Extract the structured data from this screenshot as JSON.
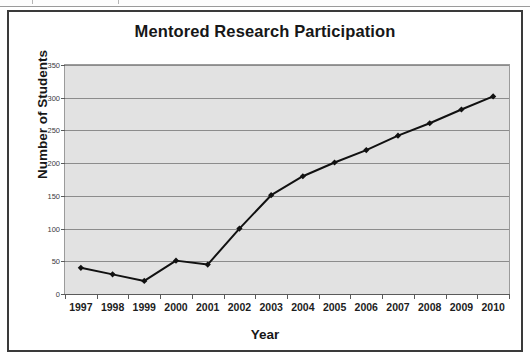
{
  "figure": {
    "title": "Mentored Research Participation",
    "x_axis_title": "Year",
    "y_axis_title": "Number of Students"
  },
  "colors": {
    "plot_background": "#e2e2e2",
    "gridline": "#8c8c8c",
    "series_line": "#111111",
    "frame_border": "#3a3a3a",
    "text": "#171717"
  },
  "chart_data": {
    "type": "line",
    "title": "Mentored Research Participation",
    "xlabel": "Year",
    "ylabel": "Number of Students",
    "categories": [
      "1997",
      "1998",
      "1999",
      "2000",
      "2001",
      "2002",
      "2003",
      "2004",
      "2005",
      "2006",
      "2007",
      "2008",
      "2009",
      "2010"
    ],
    "values": [
      40,
      30,
      20,
      51,
      45,
      100,
      151,
      180,
      201,
      220,
      242,
      261,
      282,
      302
    ],
    "series": [
      {
        "name": "Number of Students",
        "values": [
          40,
          30,
          20,
          51,
          45,
          100,
          151,
          180,
          201,
          220,
          242,
          261,
          282,
          302
        ]
      }
    ],
    "ylim": [
      0,
      350
    ],
    "yticks": [
      0,
      50,
      100,
      150,
      200,
      250,
      300,
      350
    ],
    "ytick_labels": [
      "0",
      "50",
      "100",
      "150",
      "200",
      "250",
      "300",
      "350"
    ],
    "grid": "horizontal",
    "legend": "none",
    "marker": "diamond",
    "line_width": 2
  }
}
